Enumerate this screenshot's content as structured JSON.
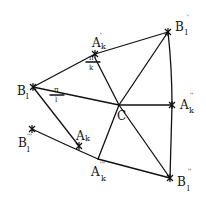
{
  "diagram": {
    "type": "geometric-construction",
    "colors": {
      "ink": "#111111",
      "background": "#ffffff"
    },
    "points": {
      "B_l": {
        "x": 33,
        "y": 87,
        "label": "B",
        "sub": "l",
        "sup": ""
      },
      "A_k1": {
        "x": 95,
        "y": 54,
        "label": "A",
        "sub": "k",
        "sup": "'"
      },
      "B_l1": {
        "x": 168,
        "y": 32,
        "label": "B",
        "sub": "l",
        "sup": "'"
      },
      "C": {
        "x": 119,
        "y": 105,
        "label": "C",
        "sub": "",
        "sup": ""
      },
      "A_k2": {
        "x": 172,
        "y": 105,
        "label": "A",
        "sub": "k",
        "sup": "''"
      },
      "B_l2": {
        "x": 170,
        "y": 178,
        "label": "B",
        "sub": "l",
        "sup": "''"
      },
      "A_k3": {
        "x": 98,
        "y": 159,
        "label": "A",
        "sub": "k",
        "sup": "'''"
      },
      "A_k": {
        "x": 79,
        "y": 146,
        "label": "A",
        "sub": "k",
        "sup": ""
      },
      "B_l3": {
        "x": 32,
        "y": 129,
        "label": "B",
        "sub": "l",
        "sup": "'''"
      }
    },
    "angle_labels": [
      {
        "id": "angle-at-B_l",
        "numerator": "π",
        "denominator": "l"
      },
      {
        "id": "angle-at-A_k1",
        "numerator": "π",
        "denominator": "k"
      }
    ]
  }
}
